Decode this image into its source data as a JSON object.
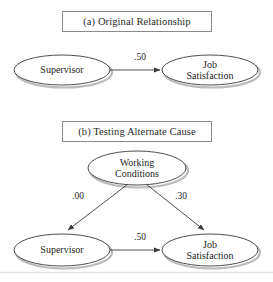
{
  "figure": {
    "background_color": "#ffffff",
    "stroke_color": "#3a3a3a",
    "shadow_color": "#b9b9b9",
    "text_color": "#1d1d1d"
  },
  "panels": [
    {
      "id": "a",
      "title": "(a) Original Relationship",
      "nodes": [
        {
          "id": "supervisor_a",
          "label_line1": "Supervisor",
          "label_line2": "",
          "cx": 62,
          "cy": 70,
          "rx": 48,
          "ry": 15
        },
        {
          "id": "job_satisfaction_a",
          "label_line1": "Job",
          "label_line2": "Satisfaction",
          "cx": 210,
          "cy": 70,
          "rx": 48,
          "ry": 15
        }
      ],
      "edges": [
        {
          "id": "edge_sup_to_js_a",
          "from": "supervisor_a",
          "to": "job_satisfaction_a",
          "label": ".50",
          "label_x": 140,
          "label_y": 59
        }
      ]
    },
    {
      "id": "b",
      "title": "(b) Testing Alternate Cause",
      "nodes": [
        {
          "id": "working_conditions",
          "label_line1": "Working",
          "label_line2": "Conditions",
          "cx": 137,
          "cy": 168,
          "rx": 49,
          "ry": 17
        },
        {
          "id": "supervisor_b",
          "label_line1": "Supervisor",
          "label_line2": "",
          "cx": 62,
          "cy": 250,
          "rx": 48,
          "ry": 16
        },
        {
          "id": "job_satisfaction_b",
          "label_line1": "Job",
          "label_line2": "Satisfaction",
          "cx": 210,
          "cy": 250,
          "rx": 48,
          "ry": 16
        }
      ],
      "edges": [
        {
          "id": "edge_wc_to_sup",
          "from": "working_conditions",
          "to": "supervisor_b",
          "label": ".00",
          "label_x": 78,
          "label_y": 198
        },
        {
          "id": "edge_wc_to_js",
          "from": "working_conditions",
          "to": "job_satisfaction_b",
          "label": ".30",
          "label_x": 181,
          "label_y": 198
        },
        {
          "id": "edge_sup_to_js_b",
          "from": "supervisor_b",
          "to": "job_satisfaction_b",
          "label": ".50",
          "label_x": 140,
          "label_y": 239
        }
      ]
    }
  ]
}
